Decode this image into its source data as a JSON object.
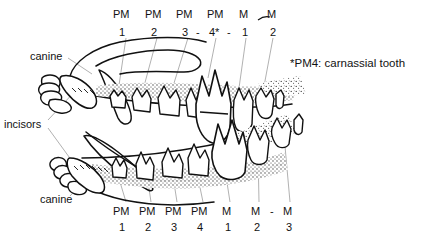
{
  "figure": {
    "ink_color": "#111111",
    "leader_color": "#9a9a9a",
    "stipple_color": "#333333",
    "background": "#ffffff"
  },
  "upper_jaw": {
    "name": "upper-jaw",
    "teeth_labels": [
      {
        "id": "u-pm1",
        "abbr": "PM",
        "num": "1",
        "x": 120,
        "y_abbr": 8,
        "y_num": 26
      },
      {
        "id": "u-pm2",
        "abbr": "PM",
        "num": "2",
        "x": 152,
        "y_abbr": 8,
        "y_num": 26
      },
      {
        "id": "u-pm3",
        "abbr": "PM",
        "num": "3",
        "x": 183,
        "y_abbr": 8,
        "y_num": 26
      },
      {
        "id": "u-pm4",
        "abbr": "PM",
        "num": "4*",
        "x": 214,
        "y_abbr": 8,
        "y_num": 26
      },
      {
        "id": "u-m1",
        "abbr": "M",
        "num": "1",
        "x": 243,
        "y_abbr": 8,
        "y_num": 26
      },
      {
        "id": "u-m2",
        "abbr": "M",
        "num": "2",
        "x": 270,
        "y_abbr": 8,
        "y_num": 26
      }
    ],
    "separators": [
      "-",
      "-"
    ]
  },
  "lower_jaw": {
    "name": "lower-jaw",
    "teeth_labels": [
      {
        "id": "l-pm1",
        "abbr": "PM",
        "num": "1",
        "x": 120,
        "y_abbr": 206,
        "y_num": 221
      },
      {
        "id": "l-pm2",
        "abbr": "PM",
        "num": "2",
        "x": 146,
        "y_abbr": 206,
        "y_num": 221
      },
      {
        "id": "l-pm3",
        "abbr": "PM",
        "num": "3",
        "x": 172,
        "y_abbr": 206,
        "y_num": 221
      },
      {
        "id": "l-pm4",
        "abbr": "PM",
        "num": "4",
        "x": 198,
        "y_abbr": 206,
        "y_num": 221
      },
      {
        "id": "l-m1",
        "abbr": "M",
        "num": "1",
        "x": 226,
        "y_abbr": 206,
        "y_num": 221
      },
      {
        "id": "l-m2",
        "abbr": "M",
        "num": "2",
        "x": 255,
        "y_abbr": 206,
        "y_num": 221
      },
      {
        "id": "l-m3",
        "abbr": "M",
        "num": "3",
        "x": 286,
        "y_abbr": 206,
        "y_num": 221
      }
    ],
    "separators": [
      "-"
    ]
  },
  "side_labels": {
    "canine_upper": "canine",
    "incisors": "incisors",
    "canine_lower": "canine"
  },
  "footnote": {
    "text": "*PM4: carnassial tooth"
  },
  "legend_keys": {
    "pm": "PM",
    "m": "M",
    "asterisk": "*"
  }
}
